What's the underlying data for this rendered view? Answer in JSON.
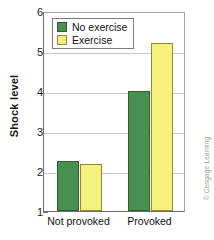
{
  "chart_data": {
    "type": "bar",
    "title": "",
    "xlabel": "",
    "ylabel": "Shock level",
    "categories": [
      "Not provoked",
      "Provoked"
    ],
    "series": [
      {
        "name": "No exercise",
        "color": "#489050",
        "values": [
          2.25,
          4.0
        ]
      },
      {
        "name": "Exercise",
        "color": "#f6f07c",
        "values": [
          2.17,
          5.2
        ]
      }
    ],
    "ylim": [
      1,
      6
    ],
    "yticks": [
      1,
      2,
      3,
      4,
      5,
      6
    ],
    "ytick_labels": [
      "1",
      "2",
      "3",
      "4",
      "5",
      "6"
    ],
    "grid": true,
    "legend_position": "top-left"
  },
  "legend": {
    "items": [
      {
        "label": "No exercise",
        "color": "#489050"
      },
      {
        "label": "Exercise",
        "color": "#f6f07c"
      }
    ]
  },
  "credit": {
    "text": "© Cengage Learning"
  }
}
